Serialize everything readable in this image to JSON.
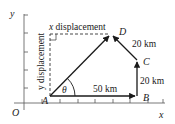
{
  "axes": {
    "x_label": "x",
    "y_label": "y",
    "origin_label": "O"
  },
  "points": {
    "A": "A",
    "B": "B",
    "C": "C",
    "D": "D"
  },
  "vectors": {
    "AB": "50 km",
    "BC": "20 km",
    "CD": "20 km"
  },
  "labels": {
    "x_displacement_italic": "x",
    "x_displacement_text": " displacement",
    "y_displacement": "y displacement",
    "angle": "θ"
  },
  "colors": {
    "line": "#1a1a1a",
    "axis": "#555555",
    "dash": "#333333"
  }
}
